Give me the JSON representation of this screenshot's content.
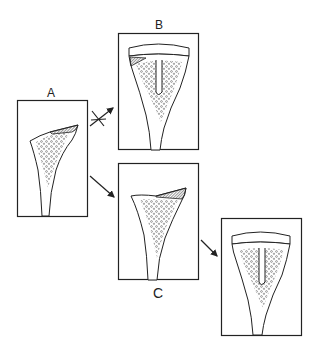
{
  "panels": {
    "a": {
      "label": "A"
    },
    "b": {
      "label": "B"
    },
    "c": {
      "label": "C"
    },
    "d": {
      "label": ""
    }
  },
  "arrows": [
    {
      "from": "A",
      "to": "B",
      "blocked": true
    },
    {
      "from": "A",
      "to": "C",
      "blocked": false
    },
    {
      "from": "C",
      "to": "D",
      "blocked": false
    }
  ],
  "colors": {
    "line": "#222222",
    "hatch": "#555555",
    "background": "#ffffff"
  }
}
